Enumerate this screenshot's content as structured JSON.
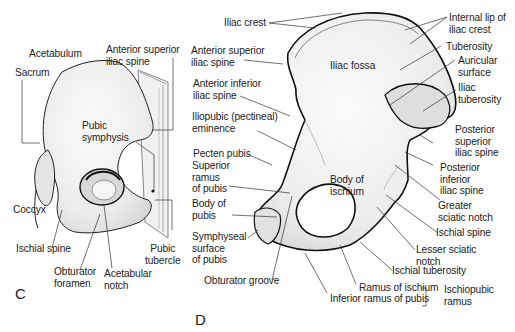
{
  "figure": {
    "panel_c": {
      "letter": "C",
      "labels": {
        "acetabulum": "Acetabulum",
        "sacrum": "Sacrum",
        "asis_1": "Anterior superior",
        "asis_2": "iliac spine",
        "pubic_symphysis_1": "Pubic",
        "pubic_symphysis_2": "symphysis",
        "coccyx": "Coccyx",
        "ischial_spine": "Ischial spine",
        "pubic_tubercle_1": "Pubic",
        "pubic_tubercle_2": "tubercle",
        "obturator_foramen_1": "Obturator",
        "obturator_foramen_2": "foramen",
        "acetabular_notch_1": "Acetabular",
        "acetabular_notch_2": "notch"
      }
    },
    "panel_d": {
      "letter": "D",
      "labels": {
        "iliac_crest": "Iliac crest",
        "asis_1": "Anterior superior",
        "asis_2": "iliac spine",
        "aiis_1": "Anterior inferior",
        "aiis_2": "iliac spine",
        "iliopubic_1": "Iliopubic (pectineal)",
        "iliopubic_2": "eminence",
        "pecten_pubis": "Pecten pubis",
        "sup_ramus_1": "Superior",
        "sup_ramus_2": "ramus",
        "sup_ramus_3": "of pubis",
        "body_pubis_1": "Body of",
        "body_pubis_2": "pubis",
        "symph_1": "Symphyseal",
        "symph_2": "surface",
        "symph_3": "of pubis",
        "obturator_groove": "Obturator groove",
        "iliac_fossa": "Iliac fossa",
        "body_ischium_1": "Body of",
        "body_ischium_2": "ischium",
        "internal_lip_1": "Internal lip of",
        "internal_lip_2": "iliac crest",
        "tuberosity": "Tuberosity",
        "auricular_1": "Auricular",
        "auricular_2": "surface",
        "iliac_tub_1": "Iliac",
        "iliac_tub_2": "tuberosity",
        "psis_1": "Posterior",
        "psis_2": "superior",
        "psis_3": "iliac spine",
        "piis_1": "Posterior",
        "piis_2": "inferior",
        "piis_3": "iliac spine",
        "greater_sciatic_1": "Greater",
        "greater_sciatic_2": "sciatic notch",
        "ischial_spine": "Ischial spine",
        "lesser_sciatic_1": "Lesser sciatic",
        "lesser_sciatic_2": "notch",
        "ischial_tuberosity": "Ischial tuberosity",
        "ramus_ischium": "Ramus of ischium",
        "inf_ramus_pubis": "Inferior ramus of pubis",
        "ischiopubic_1": "Ischiopubic",
        "ischiopubic_2": "ramus"
      }
    },
    "colors": {
      "bone_fill": "#ececec",
      "outline": "#111111",
      "leader": "#333333",
      "background": "#ffffff"
    }
  }
}
